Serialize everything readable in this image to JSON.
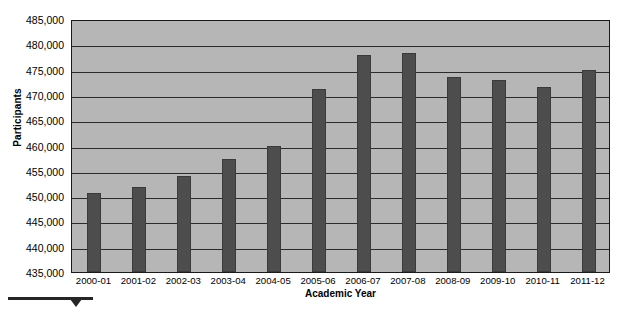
{
  "chart_data": {
    "type": "bar",
    "title": "",
    "xlabel": "Academic Year",
    "ylabel": "Participants",
    "categories": [
      "2000-01",
      "2001-02",
      "2002-03",
      "2003-04",
      "2004-05",
      "2005-06",
      "2006-07",
      "2007-08",
      "2008-09",
      "2009-10",
      "2010-11",
      "2011-12"
    ],
    "values": [
      450600,
      451800,
      454000,
      457400,
      460000,
      471200,
      477800,
      478300,
      473600,
      473000,
      471500,
      474900
    ],
    "ylim": [
      435000,
      485000
    ],
    "ytick_step": 5000,
    "ytick_labels": [
      "485,000",
      "480,000",
      "475,000",
      "470,000",
      "465,000",
      "460,000",
      "455,000",
      "450,000",
      "445,000",
      "440,000",
      "435,000"
    ],
    "ytick_values": [
      485000,
      480000,
      475000,
      470000,
      465000,
      460000,
      455000,
      450000,
      445000,
      440000,
      435000
    ],
    "grid": true,
    "legend": false,
    "series": [
      {
        "name": "Participants",
        "values": [
          450600,
          451800,
          454000,
          457400,
          460000,
          471200,
          477800,
          478300,
          473600,
          473000,
          471500,
          474900
        ]
      }
    ],
    "colors": {
      "bar": "#4d4d4d",
      "plot_background": "#b6b6b6",
      "gridline": "#2b2b2b",
      "axis": "#1a1a1a",
      "text": "#000000",
      "page_background": "#ffffff"
    }
  },
  "annotation": {
    "underline_marker": "",
    "caret_marker": ""
  }
}
